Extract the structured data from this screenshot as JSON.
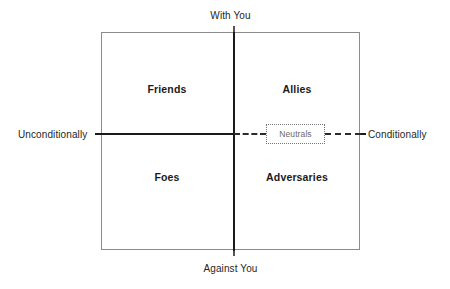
{
  "diagram": {
    "title_top": "With You",
    "title_bottom": "Against You",
    "title_left": "Unconditionally",
    "title_right": "Conditionally",
    "quadrants": [
      {
        "key": "friends",
        "label": "Friends",
        "position": "top-left"
      },
      {
        "key": "allies",
        "label": "Allies",
        "position": "top-right"
      },
      {
        "key": "foes",
        "label": "Foes",
        "position": "bottom-left"
      },
      {
        "key": "adversaries",
        "label": "Adversaries",
        "position": "bottom-right"
      }
    ],
    "center_marker": {
      "label": "Neutrals",
      "style": "dotted-box-on-dashed-axis"
    },
    "colors": {
      "frame": "#8c8c8c",
      "axis": "#1a1a1a",
      "dashed_axis": "#2b2b2b",
      "quadrant_text": "#1a1a1a",
      "axis_label_text": "#262626",
      "neutrals_text": "#6b6b6b",
      "neutrals_border": "#777777",
      "background": "#ffffff"
    }
  }
}
